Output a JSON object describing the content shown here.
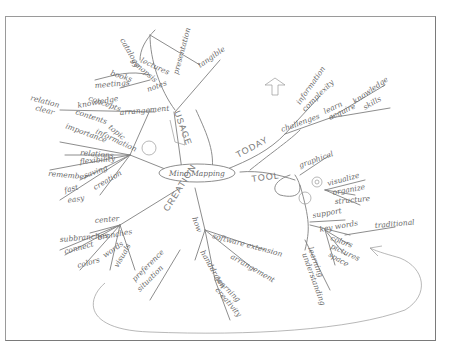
{
  "center": {
    "label": "Mind Mapping"
  },
  "branches": {
    "usage": {
      "label": "USAGE",
      "tangible": "tangible",
      "presentation_group": [
        "presentation",
        "lectures",
        "books",
        "meetings",
        "notes",
        "synopsis",
        "catalogs"
      ],
      "arrangement_group": [
        "arrangement",
        "knowledge",
        "concepts",
        "contents"
      ],
      "topic_group": [
        "topic",
        "information",
        "importance",
        "relation",
        "clear",
        "relations"
      ],
      "creative_group": [
        "relations",
        "flexibility",
        "remember",
        "saving",
        "creation",
        "fast",
        "easy"
      ]
    },
    "today": {
      "label": "TODAY",
      "challenges": "challenges",
      "items": [
        "information",
        "complexity",
        "learn",
        "acquire",
        "knowledge",
        "skills"
      ]
    },
    "tool": {
      "label": "TOOL",
      "items": [
        "graphical",
        "visualize",
        "organize",
        "structure",
        "support",
        "key words",
        "colors",
        "pictures",
        "space",
        "traditional",
        "learning",
        "understanding"
      ]
    },
    "creation": {
      "label": "CREATION",
      "center_group": [
        "center",
        "branches",
        "subbranches",
        "connect",
        "words",
        "visuals",
        "colors"
      ],
      "how_group": [
        "how",
        "software extension",
        "arrangement",
        "handdrawn",
        "learning",
        "creativity",
        "preference",
        "situation"
      ]
    }
  }
}
